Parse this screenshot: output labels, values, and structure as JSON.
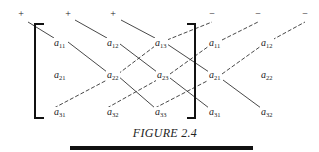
{
  "figure": {
    "caption": "FIGURE 2.4",
    "signs": [
      {
        "text": "+",
        "x": 21,
        "y": 17
      },
      {
        "text": "+",
        "x": 68,
        "y": 17
      },
      {
        "text": "+",
        "x": 113,
        "y": 17
      },
      {
        "text": "−",
        "x": 212,
        "y": 17
      },
      {
        "text": "−",
        "x": 258,
        "y": 17
      },
      {
        "text": "−",
        "x": 305,
        "y": 17
      }
    ],
    "elements": [
      {
        "base": "a",
        "sub": "11",
        "x": 54,
        "y": 46
      },
      {
        "base": "a",
        "sub": "12",
        "x": 107,
        "y": 46
      },
      {
        "base": "a",
        "sub": "13",
        "x": 155,
        "y": 46
      },
      {
        "base": "a",
        "sub": "11",
        "x": 209,
        "y": 46
      },
      {
        "base": "a",
        "sub": "12",
        "x": 261,
        "y": 46
      },
      {
        "base": "a",
        "sub": "21",
        "x": 54,
        "y": 78
      },
      {
        "base": "a",
        "sub": "22",
        "x": 107,
        "y": 78
      },
      {
        "base": "a",
        "sub": "23",
        "x": 157,
        "y": 78
      },
      {
        "base": "a",
        "sub": "21",
        "x": 209,
        "y": 78
      },
      {
        "base": "a",
        "sub": "22",
        "x": 261,
        "y": 78
      },
      {
        "base": "a",
        "sub": "31",
        "x": 54,
        "y": 115
      },
      {
        "base": "a",
        "sub": "32",
        "x": 107,
        "y": 115
      },
      {
        "base": "a",
        "sub": "33",
        "x": 155,
        "y": 115
      },
      {
        "base": "a",
        "sub": "31",
        "x": 209,
        "y": 115
      },
      {
        "base": "a",
        "sub": "32",
        "x": 261,
        "y": 115
      }
    ],
    "solid_diagonals": [
      [
        [
          28,
          22
        ],
        [
          54,
          38
        ],
        [
          68,
          42
        ],
        [
          107,
          72
        ],
        [
          118,
          76
        ],
        [
          155,
          108
        ]
      ],
      [
        [
          75,
          20
        ],
        [
          107,
          38
        ],
        [
          120,
          44
        ],
        [
          157,
          72
        ],
        [
          170,
          78
        ],
        [
          209,
          108
        ]
      ],
      [
        [
          121,
          20
        ],
        [
          155,
          38
        ],
        [
          167,
          44
        ],
        [
          209,
          72
        ],
        [
          223,
          80
        ],
        [
          261,
          108
        ]
      ]
    ],
    "dashed_diagonals": [
      [
        [
          54,
          108
        ],
        [
          107,
          80
        ],
        [
          118,
          74
        ],
        [
          155,
          46
        ],
        [
          167,
          40
        ],
        [
          212,
          22
        ]
      ],
      [
        [
          107,
          108
        ],
        [
          157,
          80
        ],
        [
          170,
          74
        ],
        [
          209,
          46
        ],
        [
          222,
          40
        ],
        [
          258,
          22
        ]
      ],
      [
        [
          155,
          108
        ],
        [
          209,
          80
        ],
        [
          222,
          74
        ],
        [
          261,
          46
        ],
        [
          272,
          40
        ],
        [
          305,
          22
        ]
      ]
    ],
    "colors": {
      "ink": "#222222",
      "rule": "#111111",
      "background": "#ffffff"
    }
  }
}
